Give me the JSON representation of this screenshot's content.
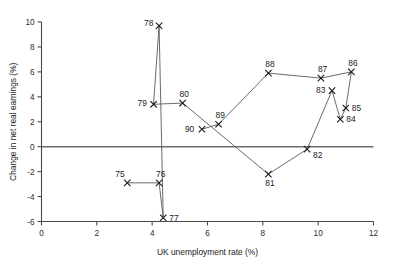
{
  "chart_data": {
    "type": "scatter",
    "title": "",
    "xlabel": "UK unemployment rate (%)",
    "ylabel": "Change in net real earnings (%)",
    "xlim": [
      0,
      12
    ],
    "ylim": [
      -6,
      10
    ],
    "xticks": [
      0,
      2,
      4,
      6,
      8,
      10,
      12
    ],
    "xtick_labels": [
      "0",
      "2",
      "4",
      "6",
      "8",
      "10",
      "12"
    ],
    "yticks": [
      -6,
      -4,
      -2,
      0,
      2,
      4,
      6,
      8,
      10
    ],
    "ytick_labels": [
      "-6",
      "-4",
      "-2",
      "0",
      "2",
      "4",
      "6",
      "8",
      "10"
    ],
    "grid": false,
    "legend": "none",
    "marker_style": "x",
    "connected": true,
    "zero_line": 0,
    "point_labels": [
      "75",
      "76",
      "77",
      "78",
      "79",
      "80",
      "81",
      "82",
      "83",
      "84",
      "85",
      "86",
      "87",
      "88",
      "89",
      "90"
    ],
    "x": [
      3.1,
      4.25,
      4.4,
      4.25,
      4.05,
      5.1,
      8.2,
      9.6,
      10.5,
      10.8,
      11.0,
      11.2,
      10.1,
      8.2,
      6.4,
      5.8
    ],
    "y": [
      -2.9,
      -2.9,
      -5.7,
      9.7,
      3.4,
      3.5,
      -2.2,
      -0.2,
      4.5,
      2.2,
      3.1,
      6.0,
      5.5,
      5.9,
      1.8,
      1.4
    ],
    "points": [
      {
        "label": "75",
        "x": 3.1,
        "y": -2.9,
        "label_dx": -12,
        "label_dy": -6
      },
      {
        "label": "76",
        "x": 4.25,
        "y": -2.9,
        "label_dx": -3,
        "label_dy": -6
      },
      {
        "label": "77",
        "x": 4.4,
        "y": -5.7,
        "label_dx": 6,
        "label_dy": 3
      },
      {
        "label": "78",
        "x": 4.25,
        "y": 9.7,
        "label_dx": -15,
        "label_dy": 0
      },
      {
        "label": "79",
        "x": 4.05,
        "y": 3.4,
        "label_dx": -16,
        "label_dy": 2
      },
      {
        "label": "80",
        "x": 5.1,
        "y": 3.5,
        "label_dx": -3,
        "label_dy": -6
      },
      {
        "label": "81",
        "x": 8.2,
        "y": -2.2,
        "label_dx": -3,
        "label_dy": 12
      },
      {
        "label": "82",
        "x": 9.6,
        "y": -0.2,
        "label_dx": 6,
        "label_dy": 9
      },
      {
        "label": "83",
        "x": 10.5,
        "y": 4.5,
        "label_dx": -16,
        "label_dy": 2
      },
      {
        "label": "84",
        "x": 10.8,
        "y": 2.2,
        "label_dx": 6,
        "label_dy": 3
      },
      {
        "label": "85",
        "x": 11.0,
        "y": 3.1,
        "label_dx": 6,
        "label_dy": 3
      },
      {
        "label": "86",
        "x": 11.2,
        "y": 6.0,
        "label_dx": -3,
        "label_dy": -6
      },
      {
        "label": "87",
        "x": 10.1,
        "y": 5.5,
        "label_dx": -3,
        "label_dy": -6
      },
      {
        "label": "88",
        "x": 8.2,
        "y": 5.9,
        "label_dx": -3,
        "label_dy": -6
      },
      {
        "label": "89",
        "x": 6.4,
        "y": 1.8,
        "label_dx": -3,
        "label_dy": -6
      },
      {
        "label": "90",
        "x": 5.8,
        "y": 1.4,
        "label_dx": -17,
        "label_dy": 3
      }
    ]
  }
}
